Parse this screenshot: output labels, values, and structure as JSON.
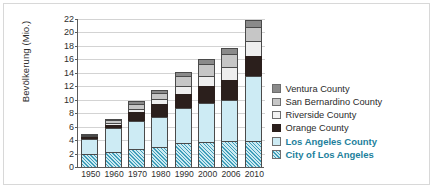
{
  "chart_data": {
    "type": "bar",
    "subtype": "stacked-bar",
    "title": "",
    "xlabel": "",
    "ylabel": "Bevölkerung (Mio.)",
    "ylim": [
      0,
      22
    ],
    "ytick_step": 2,
    "yticks": [
      0,
      2,
      4,
      6,
      8,
      10,
      12,
      14,
      16,
      18,
      20,
      22
    ],
    "grid": true,
    "legend_position": "right",
    "categories": [
      "1950",
      "1960",
      "1970",
      "1980",
      "1990",
      "2000",
      "2006",
      "2010"
    ],
    "stack_order_bottom_to_top": [
      "City of Los Angeles",
      "Los Angeles County",
      "Orange County",
      "Riverside County",
      "San Bernardino County",
      "Ventura County"
    ],
    "series": [
      {
        "name": "City of Los Angeles",
        "key": "city",
        "color": "#cceaf2",
        "hatch": true,
        "values": [
          2.0,
          2.3,
          2.7,
          3.0,
          3.5,
          3.7,
          3.9,
          3.9
        ]
      },
      {
        "name": "Los Angeles County",
        "key": "lac",
        "color": "#cdebf4",
        "values": [
          2.2,
          3.5,
          4.1,
          4.5,
          5.3,
          5.8,
          6.0,
          9.6
        ]
      },
      {
        "name": "Orange County",
        "key": "oc",
        "color": "#2b1f1c",
        "values": [
          0.2,
          0.4,
          1.4,
          1.9,
          2.1,
          2.6,
          3.0,
          3.0
        ]
      },
      {
        "name": "Riverside County",
        "key": "riv",
        "color": "#eeeeee",
        "values": [
          0.17,
          0.3,
          0.5,
          0.7,
          1.2,
          1.5,
          1.9,
          2.2
        ]
      },
      {
        "name": "San Bernardino County",
        "key": "sb",
        "color": "#c6c6c6",
        "values": [
          0.18,
          0.5,
          0.7,
          0.9,
          1.4,
          1.7,
          2.0,
          2.1
        ]
      },
      {
        "name": "Ventura County",
        "key": "ven",
        "color": "#8a8a8a",
        "values": [
          0.1,
          0.2,
          0.4,
          0.5,
          0.7,
          0.8,
          0.9,
          1.0
        ]
      }
    ],
    "totals": [
      4.85,
      7.2,
      9.8,
      11.5,
      14.2,
      16.1,
      17.7,
      21.8
    ]
  },
  "axis": {
    "y_title": "Bevölkerung (Mio.)"
  },
  "legend": {
    "items": [
      {
        "label": "Ventura County",
        "swatch": "ven",
        "highlight": false
      },
      {
        "label": "San Bernardino County",
        "swatch": "sb",
        "highlight": false
      },
      {
        "label": "Riverside County",
        "swatch": "riv",
        "highlight": false
      },
      {
        "label": "Orange County",
        "swatch": "oc",
        "highlight": false
      },
      {
        "label": "Los Angeles County",
        "swatch": "lac",
        "highlight": true
      },
      {
        "label": "City of Los Angeles",
        "swatch": "city",
        "highlight": true
      }
    ]
  },
  "colors": {
    "accent": "#1d7f9c",
    "ventura": "#8a8a8a",
    "san_bernardino": "#c6c6c6",
    "riverside": "#eeeeee",
    "orange": "#2b1f1c",
    "los_angeles_county": "#cdebf4",
    "city_of_los_angeles": "#cceaf2",
    "axis": "#5b5b5b",
    "grid": "#d3d3d3",
    "frame": "#d8d8d8"
  }
}
